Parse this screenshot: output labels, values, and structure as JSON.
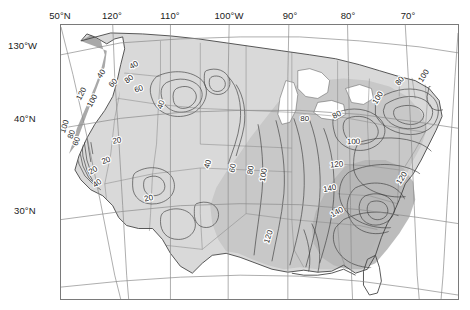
{
  "figure": {
    "type": "contour-map",
    "region": "Contiguous United States",
    "projection": "conic",
    "background_color": "#ffffff",
    "frame_color": "#7a7a7a"
  },
  "axes": {
    "top_labels": [
      {
        "text": "50°N",
        "x": 60
      },
      {
        "text": "120°",
        "x": 112
      },
      {
        "text": "110°",
        "x": 170
      },
      {
        "text": "100°W",
        "x": 229
      },
      {
        "text": "90°",
        "x": 290
      },
      {
        "text": "80°",
        "x": 348
      },
      {
        "text": "70°",
        "x": 408
      }
    ],
    "left_labels": [
      {
        "text": "130°W",
        "y": 45
      },
      {
        "text": "40°N",
        "y": 118
      },
      {
        "text": "30°N",
        "y": 210
      }
    ]
  },
  "legend_fills": {
    "land_light": "#d9d9d9",
    "land_mid": "#c4c4c4",
    "land_dark": "#b5b5b5",
    "water": "#ffffff",
    "outline": "#555555",
    "state_border": "#777777",
    "contour_line": "#3c3c3c",
    "graticule": "#8a8a8a"
  },
  "chart_data": {
    "type": "contour",
    "title": "",
    "xlabel": "",
    "ylabel": "",
    "contour_interval": 20,
    "contour_levels": [
      20,
      40,
      60,
      80,
      100,
      120,
      140
    ],
    "labels": [
      {
        "value": "40",
        "x": 133,
        "y": 64,
        "rot": -30
      },
      {
        "value": "40",
        "x": 100,
        "y": 73,
        "rot": -55
      },
      {
        "value": "80",
        "x": 128,
        "y": 78,
        "rot": -38
      },
      {
        "value": "60",
        "x": 112,
        "y": 82,
        "rot": -45
      },
      {
        "value": "60",
        "x": 138,
        "y": 88,
        "rot": -20
      },
      {
        "value": "120",
        "x": 80,
        "y": 93,
        "rot": -62
      },
      {
        "value": "100",
        "x": 91,
        "y": 100,
        "rot": -62
      },
      {
        "value": "40",
        "x": 160,
        "y": 104,
        "rot": -70
      },
      {
        "value": "100",
        "x": 63,
        "y": 126,
        "rot": -72
      },
      {
        "value": "80",
        "x": 70,
        "y": 134,
        "rot": -70
      },
      {
        "value": "60",
        "x": 75,
        "y": 141,
        "rot": -70
      },
      {
        "value": "20",
        "x": 116,
        "y": 140,
        "rot": -10
      },
      {
        "value": "20",
        "x": 92,
        "y": 170,
        "rot": -30
      },
      {
        "value": "40",
        "x": 96,
        "y": 183,
        "rot": -35
      },
      {
        "value": "20",
        "x": 105,
        "y": 160,
        "rot": -20
      },
      {
        "value": "20",
        "x": 148,
        "y": 198,
        "rot": -12
      },
      {
        "value": "40",
        "x": 207,
        "y": 164,
        "rot": -72
      },
      {
        "value": "60",
        "x": 232,
        "y": 168,
        "rot": -78
      },
      {
        "value": "80",
        "x": 250,
        "y": 170,
        "rot": -80
      },
      {
        "value": "100",
        "x": 263,
        "y": 175,
        "rot": -80
      },
      {
        "value": "120",
        "x": 268,
        "y": 237,
        "rot": -72
      },
      {
        "value": "80",
        "x": 305,
        "y": 118,
        "rot": 0
      },
      {
        "value": "80",
        "x": 337,
        "y": 114,
        "rot": -28
      },
      {
        "value": "100",
        "x": 354,
        "y": 141,
        "rot": -2
      },
      {
        "value": "100",
        "x": 378,
        "y": 97,
        "rot": -58
      },
      {
        "value": "80",
        "x": 400,
        "y": 80,
        "rot": -52
      },
      {
        "value": "100",
        "x": 424,
        "y": 75,
        "rot": -58
      },
      {
        "value": "120",
        "x": 337,
        "y": 164,
        "rot": -4
      },
      {
        "value": "120",
        "x": 402,
        "y": 178,
        "rot": -58
      },
      {
        "value": "140",
        "x": 330,
        "y": 188,
        "rot": -10
      },
      {
        "value": "140",
        "x": 337,
        "y": 212,
        "rot": -28
      }
    ]
  }
}
